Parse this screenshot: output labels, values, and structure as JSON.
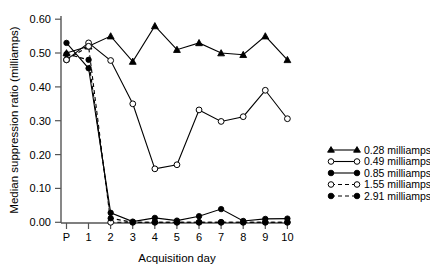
{
  "chart_data": {
    "type": "line",
    "title": "",
    "xlabel": "Acquisition day",
    "ylabel": "Median suppression ratio (milliamps)",
    "categories": [
      "P",
      "1",
      "2",
      "3",
      "4",
      "5",
      "6",
      "7",
      "8",
      "9",
      "10"
    ],
    "xtick_labels": [
      "P",
      "1",
      "2",
      "3",
      "4",
      "5",
      "6",
      "7",
      "8",
      "9",
      "10"
    ],
    "ytick_labels": [
      "0.00",
      "0.10",
      "0.20",
      "0.30",
      "0.40",
      "0.50",
      "0.60"
    ],
    "ytick_values": [
      0.0,
      0.1,
      0.2,
      0.3,
      0.4,
      0.5,
      0.6
    ],
    "ylim": [
      0.0,
      0.6
    ],
    "grid": false,
    "legend_position": "right",
    "series": [
      {
        "name": "0.28 milliamps",
        "marker": "filled-triangle",
        "linestyle": "solid",
        "values": [
          0.5,
          0.52,
          0.55,
          0.475,
          0.58,
          0.51,
          0.53,
          0.5,
          0.495,
          0.55,
          0.48
        ]
      },
      {
        "name": "0.49 milliamps",
        "marker": "open-circle",
        "linestyle": "solid",
        "values": [
          0.48,
          0.53,
          0.478,
          0.35,
          0.158,
          0.17,
          0.332,
          0.298,
          0.312,
          0.39,
          0.306
        ]
      },
      {
        "name": "0.85 milliamps",
        "marker": "filled-circle",
        "linestyle": "solid",
        "values": [
          0.53,
          0.455,
          0.028,
          0.002,
          0.013,
          0.005,
          0.018,
          0.039,
          0.004,
          0.01,
          0.011
        ]
      },
      {
        "name": "1.55 milliamps",
        "marker": "open-circle",
        "linestyle": "dashed",
        "values": [
          0.48,
          0.52,
          0.0,
          0.0,
          0.0,
          0.0,
          0.0,
          0.0,
          0.0,
          0.0,
          0.0
        ]
      },
      {
        "name": "2.91 milliamps",
        "marker": "filled-circle",
        "linestyle": "dashed",
        "values": [
          0.497,
          0.48,
          0.012,
          0.0,
          0.0,
          0.0,
          0.0,
          0.0,
          0.0,
          0.0,
          0.0
        ]
      }
    ]
  },
  "legend": {
    "entries": [
      {
        "label": "0.28 milliamps"
      },
      {
        "label": "0.49 milliamps"
      },
      {
        "label": "0.85 milliamps"
      },
      {
        "label": "1.55 milliamps"
      },
      {
        "label": "2.91 milliamps"
      }
    ]
  },
  "axes": {
    "x_title": "Acquisition day",
    "y_title": "Median suppression ratio (milliamps)"
  },
  "colors": {
    "ink": "#000000",
    "axis": "#555555",
    "background": "#ffffff"
  }
}
